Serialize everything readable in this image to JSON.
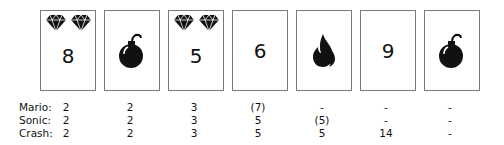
{
  "cards": [
    {
      "type": "number",
      "value": "8",
      "gems": 2
    },
    {
      "type": "bomb",
      "value": "",
      "gems": 0
    },
    {
      "type": "number",
      "value": "5",
      "gems": 2
    },
    {
      "type": "number",
      "value": "6",
      "gems": 0
    },
    {
      "type": "fire",
      "value": "",
      "gems": 0
    },
    {
      "type": "number",
      "value": "9",
      "gems": 0
    },
    {
      "type": "bomb",
      "value": "",
      "gems": 0
    }
  ],
  "scores": [
    {
      "player": "Mario:",
      "values": [
        "2",
        "2",
        "3",
        "(7)",
        "-",
        "-",
        "-"
      ]
    },
    {
      "player": "Sonic:",
      "values": [
        "2",
        "2",
        "3",
        "5",
        "(5)",
        "-",
        "-"
      ]
    },
    {
      "player": "Crash:",
      "values": [
        "2",
        "2",
        "3",
        "5",
        "5",
        "14",
        "-"
      ]
    }
  ],
  "colors": {
    "card_border": "#7a7a7a",
    "ink": "#111111"
  }
}
